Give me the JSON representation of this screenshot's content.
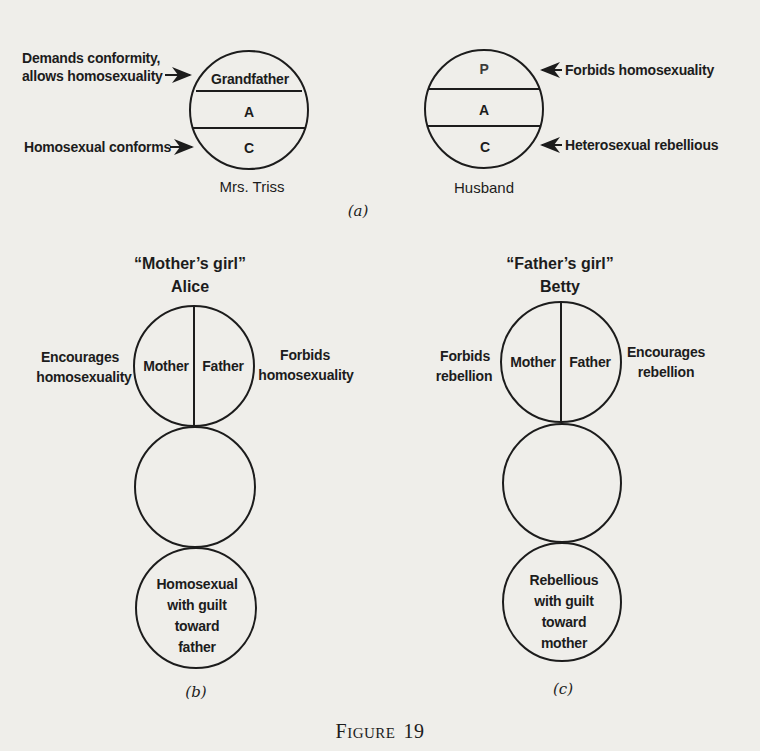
{
  "figure": {
    "caption_prefix": "F",
    "caption_small": "IGURE",
    "caption_number": "19"
  },
  "panel_a": {
    "tag": "(a)",
    "mrs_triss": {
      "name": "Mrs. Triss",
      "segments": [
        "Grandfather",
        "A",
        "C"
      ],
      "annotations": {
        "top_line1": "Demands conformity,",
        "top_line2": "allows homosexuality",
        "bottom": "Homosexual conforms"
      }
    },
    "husband": {
      "name": "Husband",
      "segments": [
        "P",
        "A",
        "C"
      ],
      "annotations": {
        "top": "Forbids homosexuality",
        "bottom": "Heterosexual rebellious"
      }
    }
  },
  "panel_b": {
    "tag": "(b)",
    "title": "“Mother’s girl”",
    "name": "Alice",
    "top_circle": {
      "left": "Mother",
      "right": "Father"
    },
    "left_annotation": {
      "line1": "Encourages",
      "line2": "homosexuality"
    },
    "right_annotation": {
      "line1": "Forbids",
      "line2": "homosexuality"
    },
    "bottom_circle": [
      "Homosexual",
      "with guilt",
      "toward",
      "father"
    ]
  },
  "panel_c": {
    "tag": "(c)",
    "title": "“Father’s girl”",
    "name": "Betty",
    "top_circle": {
      "left": "Mother",
      "right": "Father"
    },
    "left_annotation": {
      "line1": "Forbids",
      "line2": "rebellion"
    },
    "right_annotation": {
      "line1": "Encourages",
      "line2": "rebellion"
    },
    "bottom_circle": [
      "Rebellious",
      "with guilt",
      "toward",
      "mother"
    ]
  }
}
